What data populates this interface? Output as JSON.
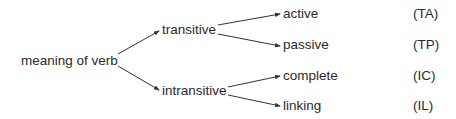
{
  "diagram": {
    "root": {
      "label": "meaning of verb"
    },
    "branches": [
      {
        "label": "transitive",
        "children": [
          {
            "label": "active",
            "code": "(TA)"
          },
          {
            "label": "passive",
            "code": "(TP)"
          }
        ]
      },
      {
        "label": "intransitive",
        "children": [
          {
            "label": "complete",
            "code": "(IC)"
          },
          {
            "label": "linking",
            "code": "(IL)"
          }
        ]
      }
    ],
    "colors": {
      "text": "#2a2a2a",
      "line": "#333333",
      "background": "#ffffff"
    }
  }
}
